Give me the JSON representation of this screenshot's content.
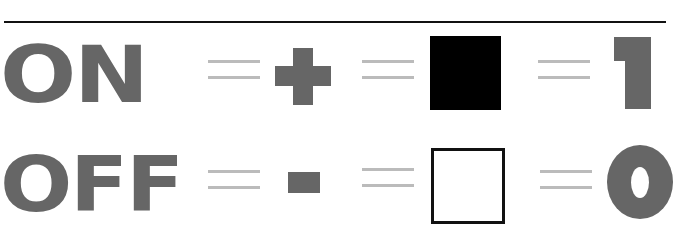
{
  "rows": [
    {
      "state": "ON",
      "sign": "+",
      "box": "filled",
      "digit": "1"
    },
    {
      "state": "OFF",
      "sign": "-",
      "box": "empty",
      "digit": "0"
    }
  ],
  "colors": {
    "text": "#666666",
    "equals": "#bbbbbb",
    "rule": "#111111",
    "filled_box": "#000000"
  }
}
